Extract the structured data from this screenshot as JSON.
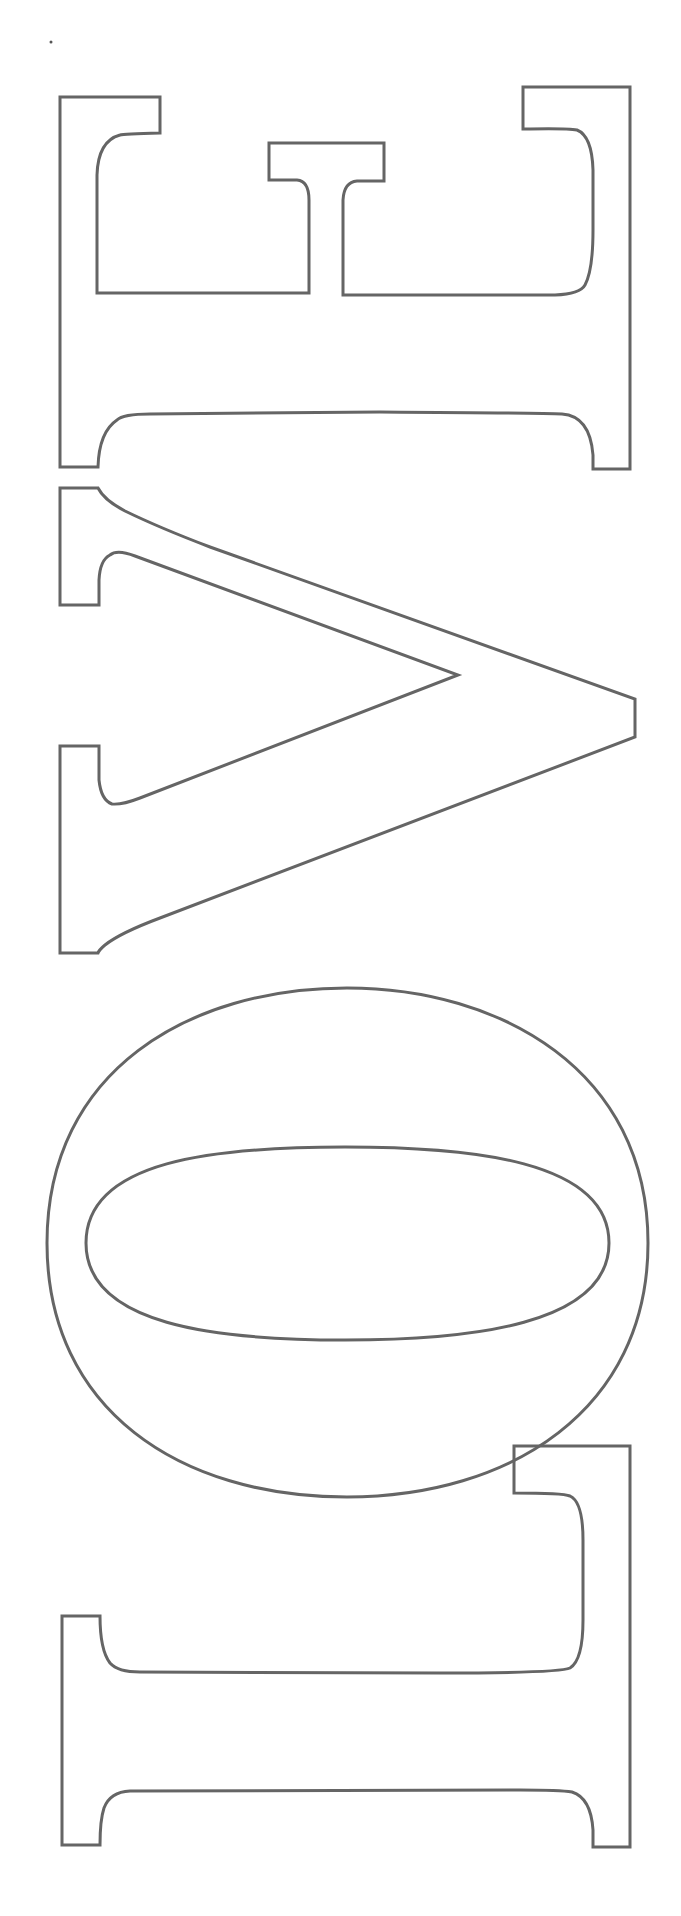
{
  "page": {
    "word": "LOVE",
    "orientation": "rotated 90 degrees, reading bottom-to-top",
    "letters_top_to_bottom": [
      "E",
      "V",
      "O",
      "L"
    ],
    "style": "outlined serif letter stencil"
  },
  "colors": {
    "background": "#ffffff",
    "outline": "#656565"
  },
  "letters": [
    {
      "char": "E",
      "label": "Letter E outline"
    },
    {
      "char": "V",
      "label": "Letter V outline"
    },
    {
      "char": "O",
      "label": "Letter O outline"
    },
    {
      "char": "L",
      "label": "Letter L outline"
    }
  ]
}
